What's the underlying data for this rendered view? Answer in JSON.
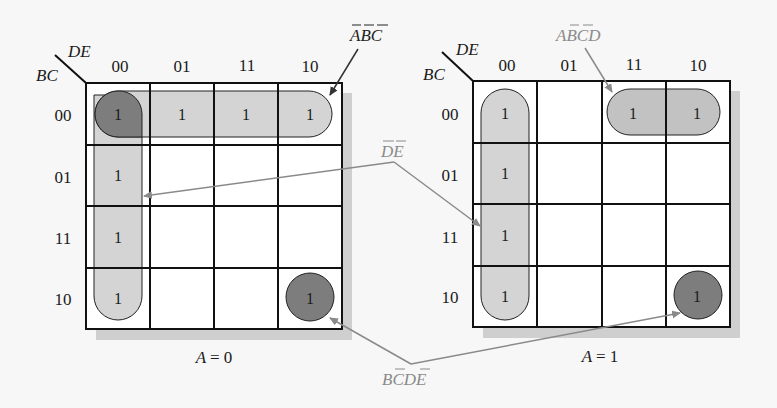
{
  "diagram": {
    "type": "karnaugh-map-5-variable",
    "variables": [
      "A",
      "B",
      "C",
      "D",
      "E"
    ],
    "row_variable_label": "BC",
    "column_variable_label": "DE",
    "column_headers": [
      "00",
      "01",
      "11",
      "10"
    ],
    "row_headers": [
      "00",
      "01",
      "11",
      "10"
    ],
    "colors": {
      "grid_line": "#111111",
      "light_group_fill": "#d4d4d4",
      "dark_group_fill": "#7d7d7d",
      "shadow": "#cfcfcf",
      "grey_annotation": "#8a8a8a",
      "background": "#f7f7f7"
    },
    "maps": [
      {
        "id": "map-a0",
        "title": "A = 0",
        "title_var": "A",
        "title_val": "= 0",
        "cells": [
          [
            "1",
            "1",
            "1",
            "1"
          ],
          [
            "1",
            "",
            "",
            ""
          ],
          [
            "1",
            "",
            "",
            ""
          ],
          [
            "1",
            "",
            "",
            "1"
          ]
        ]
      },
      {
        "id": "map-a1",
        "title": "A = 1",
        "title_var": "A",
        "title_val": "= 1",
        "cells": [
          [
            "1",
            "",
            "1",
            "1"
          ],
          [
            "1",
            "",
            "",
            ""
          ],
          [
            "1",
            "",
            "",
            ""
          ],
          [
            "1",
            "",
            "",
            "1"
          ]
        ]
      }
    ],
    "annotations": [
      {
        "id": "term-a-b-c",
        "text": "ĀB̄C̄",
        "parts": [
          "A",
          "B",
          "C"
        ],
        "overbars": [
          true,
          true,
          true
        ],
        "color": "dark",
        "points_to": "map-a0 row 00 group"
      },
      {
        "id": "term-a-bcd",
        "text": "AB̄C̄D",
        "parts": [
          "A",
          "B",
          "C",
          "D"
        ],
        "overbars": [
          false,
          true,
          true,
          false
        ],
        "color": "grey",
        "points_to": "map-a1 row 00 cols 11-10 group"
      },
      {
        "id": "term-de",
        "text": "D̄Ē",
        "parts": [
          "D",
          "E"
        ],
        "overbars": [
          true,
          true
        ],
        "color": "grey",
        "points_to": "column 00 groups in both maps"
      },
      {
        "id": "term-bcde",
        "text": "BC̄DĒ",
        "parts": [
          "B",
          "C",
          "D",
          "E"
        ],
        "overbars": [
          false,
          true,
          false,
          true
        ],
        "color": "grey",
        "points_to": "cell BC=10 DE=10 in both maps"
      }
    ]
  }
}
